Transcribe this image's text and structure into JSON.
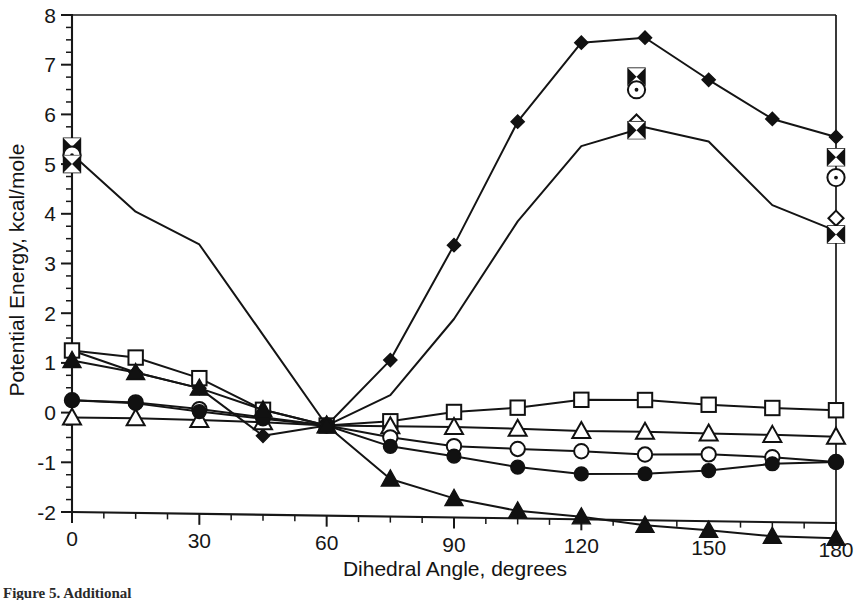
{
  "figure": {
    "caption": "Figure 5. Additional",
    "background_color": "#ffffff",
    "ink_color": "#141414"
  },
  "chart_data": {
    "type": "line",
    "title": "",
    "xlabel": "Dihedral Angle, degrees",
    "ylabel": "Potential Energy, kcal/mole",
    "xlim": [
      0,
      180
    ],
    "ylim": [
      -2,
      8
    ],
    "xticks": [
      0,
      30,
      60,
      90,
      120,
      150,
      180
    ],
    "xtick_labels": [
      "0",
      "30",
      "60",
      "90",
      "120",
      "150",
      "180"
    ],
    "yticks": [
      -2,
      -1,
      0,
      1,
      2,
      3,
      4,
      5,
      6,
      7,
      8
    ],
    "ytick_labels": [
      "-2",
      "-1",
      "0",
      "1",
      "2",
      "3",
      "4",
      "5",
      "6",
      "7",
      "8"
    ],
    "x_minor_interval": 7.5,
    "y_minor_interval": 0.25,
    "grid": false,
    "legend": "none",
    "frame": "box",
    "series": [
      {
        "name": "filled-diamond",
        "marker": "filled-diamond",
        "x": [
          0,
          15,
          30,
          45,
          60,
          75,
          90,
          105,
          120,
          135,
          150,
          165,
          180
        ],
        "y": [
          1.25,
          0.82,
          0.52,
          -0.42,
          -0.2,
          1.12,
          3.42,
          5.88,
          7.45,
          7.55,
          6.72,
          5.95,
          5.6
        ]
      },
      {
        "name": "dotted-circle",
        "marker": "dotted-circle",
        "x": [
          0,
          15,
          30,
          45,
          60,
          75,
          90,
          105,
          120,
          135,
          150,
          165,
          180
        ],
        "y": [
          5.2,
          4.05,
          3.4,
          1.6,
          -0.2,
          0.42,
          1.95,
          3.9,
          5.4,
          5.78,
          5.5,
          4.25,
          3.75
        ]
      },
      {
        "name": "open-square",
        "marker": "open-square",
        "x": [
          0,
          15,
          30,
          45,
          60,
          75,
          90,
          105,
          120,
          135,
          150,
          165,
          180
        ],
        "y": [
          1.25,
          1.12,
          0.72,
          0.1,
          -0.2,
          -0.1,
          0.1,
          0.2,
          0.37,
          0.38,
          0.3,
          0.25,
          0.22
        ]
      },
      {
        "name": "open-triangle",
        "marker": "open-triangle",
        "x": [
          0,
          15,
          30,
          45,
          60,
          75,
          90,
          105,
          120,
          135,
          150,
          165,
          180
        ],
        "y": [
          -0.1,
          -0.1,
          -0.12,
          -0.15,
          -0.2,
          -0.2,
          -0.2,
          -0.22,
          -0.25,
          -0.25,
          -0.27,
          -0.28,
          -0.3
        ]
      },
      {
        "name": "open-circle",
        "marker": "open-circle",
        "x": [
          0,
          15,
          30,
          45,
          60,
          75,
          90,
          105,
          120,
          135,
          150,
          165,
          180
        ],
        "y": [
          0.25,
          0.22,
          0.1,
          -0.05,
          -0.2,
          -0.42,
          -0.58,
          -0.62,
          -0.65,
          -0.7,
          -0.68,
          -0.72,
          -0.8
        ]
      },
      {
        "name": "filled-circle",
        "marker": "filled-circle",
        "x": [
          0,
          15,
          30,
          45,
          60,
          75,
          90,
          105,
          120,
          135,
          150,
          165,
          180
        ],
        "y": [
          0.25,
          0.2,
          0.05,
          -0.08,
          -0.2,
          -0.6,
          -0.78,
          -0.98,
          -1.1,
          -1.08,
          -1.0,
          -0.85,
          -0.8
        ]
      },
      {
        "name": "filled-triangle",
        "marker": "filled-triangle",
        "x": [
          0,
          15,
          30,
          45,
          60,
          75,
          90,
          105,
          120,
          135,
          150,
          165,
          180
        ],
        "y": [
          1.05,
          0.82,
          0.52,
          0.1,
          -0.2,
          -1.25,
          -1.62,
          -1.85,
          -1.95,
          -2.1,
          -2.18,
          -2.28,
          -2.3
        ]
      }
    ],
    "overlay_markers": [
      {
        "name": "cluster-left",
        "x": 0,
        "items": [
          {
            "marker": "x-square",
            "y": 5.35
          },
          {
            "marker": "dotted-circle",
            "y": 5.18
          },
          {
            "marker": "x-square",
            "y": 5.0
          }
        ]
      },
      {
        "name": "cluster-upper-mid",
        "x": 133,
        "items": [
          {
            "marker": "x-square",
            "y": 6.78
          },
          {
            "marker": "dotted-circle",
            "y": 6.52
          }
        ]
      },
      {
        "name": "cluster-lower-mid",
        "x": 133,
        "items": [
          {
            "marker": "open-diamond",
            "y": 5.88
          },
          {
            "marker": "x-square",
            "y": 5.72
          }
        ]
      },
      {
        "name": "cluster-right-upper",
        "x": 180,
        "items": [
          {
            "marker": "x-square",
            "y": 5.2
          },
          {
            "marker": "dotted-circle",
            "y": 4.8
          }
        ]
      },
      {
        "name": "cluster-right-lower",
        "x": 180,
        "items": [
          {
            "marker": "open-diamond",
            "y": 4.0
          },
          {
            "marker": "x-square",
            "y": 3.68
          }
        ]
      }
    ]
  }
}
